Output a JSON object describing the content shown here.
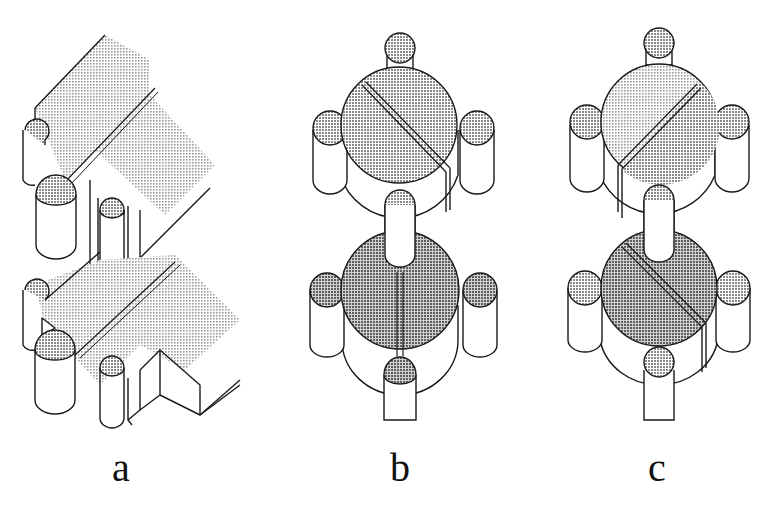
{
  "figure": {
    "panels": [
      {
        "id": "a",
        "label": "a",
        "description": "Isometric stacked slab assembly with cylindrical end knobs and grooves"
      },
      {
        "id": "b",
        "label": "b",
        "description": "Two stacked disc units with four knobs each; upper groove diagonal, lower groove vertical"
      },
      {
        "id": "c",
        "label": "c",
        "description": "Two stacked disc units with four knobs each; upper groove diagonal (rising), lower groove diagonal (falling)"
      }
    ],
    "colors": {
      "stroke": "#1a1a1a",
      "fill_light": "#d9d9d9",
      "fill_dark": "#bdbdbd",
      "background": "#ffffff"
    }
  }
}
